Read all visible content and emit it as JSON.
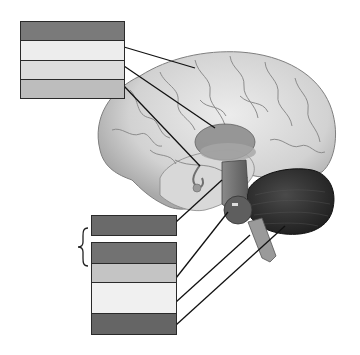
{
  "diagram": {
    "title": "",
    "top_label_group": {
      "boxes": [
        {
          "index": 0,
          "text": "",
          "fill": "#7a7a7a",
          "has_leader": false
        },
        {
          "index": 1,
          "text": "",
          "fill": "#ededed",
          "has_leader": true,
          "points_to": "cerebrum"
        },
        {
          "index": 2,
          "text": "",
          "fill": "#dcdcdc",
          "has_leader": true,
          "points_to": "thalamus"
        },
        {
          "index": 3,
          "text": "",
          "fill": "#bdbdbd",
          "has_leader": true,
          "points_to": "hypothalamus"
        }
      ]
    },
    "bottom_single_box": {
      "text": "",
      "fill": "#6a6a6a",
      "has_leader": true,
      "points_to": "midbrain"
    },
    "brace": {
      "symbol": "{",
      "groups": "brainstem"
    },
    "bottom_label_group": {
      "boxes": [
        {
          "index": 0,
          "text": "",
          "fill": "#727272",
          "has_leader": false
        },
        {
          "index": 1,
          "text": "",
          "fill": "#c4c4c4",
          "has_leader": true,
          "points_to": "pons"
        },
        {
          "index": 2,
          "text": "",
          "fill": "#f0f0f0",
          "has_leader": true,
          "points_to": "medulla"
        },
        {
          "index": 3,
          "text": "",
          "fill": "#656565",
          "has_leader": true,
          "points_to": "cerebellum"
        }
      ]
    },
    "colors": {
      "cerebrum": "#d6d6d6",
      "cerebrum_shadow": "#a8a8a8",
      "gyri_line": "#8c8c8c",
      "thalamus": "#8e8e8e",
      "brainstem": "#6e6e6e",
      "cerebellum": "#333333",
      "leader_line": "#111111",
      "box_border": "#2a2a2a"
    }
  }
}
